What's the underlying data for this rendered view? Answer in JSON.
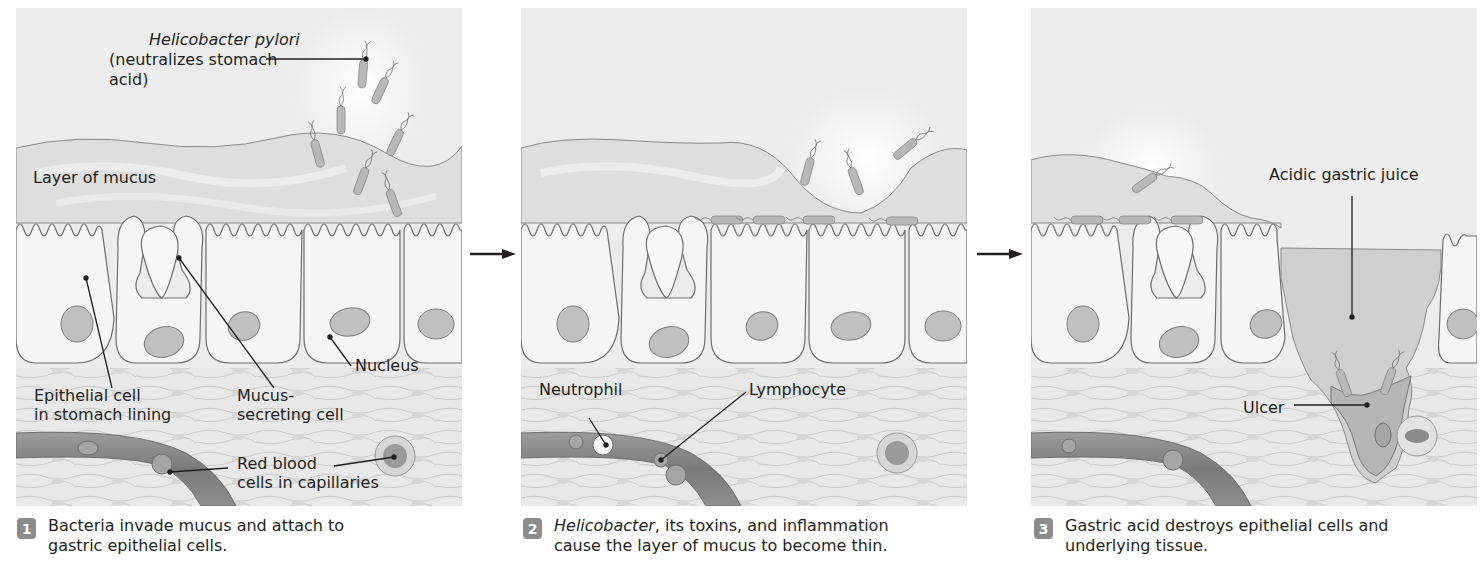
{
  "figure": {
    "steps": [
      {
        "number": "1",
        "caption": "Bacteria invade mucus and attach to gastric epithelial cells.",
        "caption_line1": "Bacteria invade mucus and attach to",
        "caption_line2": "gastric epithelial cells.",
        "labels": {
          "helicobacter_italic": "Helicobacter pylori",
          "helicobacter_line2": "(neutralizes stomach",
          "helicobacter_line3": "acid)",
          "mucus_layer": "Layer of mucus",
          "nucleus": "Nucleus",
          "epithelial_line1": "Epithelial cell",
          "epithelial_line2": "in stomach lining",
          "mucus_secreting_line1": "Mucus-",
          "mucus_secreting_line2": "secreting cell",
          "rbc_line1": "Red blood",
          "rbc_line2": "cells in capillaries"
        }
      },
      {
        "number": "2",
        "caption_italic": "Helicobacter",
        "caption_line1_rest": ", its toxins, and inflammation",
        "caption_line2": "cause the layer of mucus to become thin.",
        "labels": {
          "neutrophil": "Neutrophil",
          "lymphocyte": "Lymphocyte"
        }
      },
      {
        "number": "3",
        "caption_line1": "Gastric acid destroys epithelial cells and",
        "caption_line2": "underlying tissue.",
        "labels": {
          "acidic_juice": "Acidic gastric juice",
          "ulcer": "Ulcer"
        }
      }
    ],
    "arrows": [
      "step1-to-step2",
      "step2-to-step3"
    ],
    "colors": {
      "background": "#ececec",
      "mucus": "#dcdcdc",
      "cell_fill": "#f4f4f4",
      "cell_outline": "#6e6e6e",
      "nucleus": "#bdbdbd",
      "capillary": "#8a8a8a",
      "badge": "#8c8c8c",
      "text": "#231f20"
    }
  }
}
